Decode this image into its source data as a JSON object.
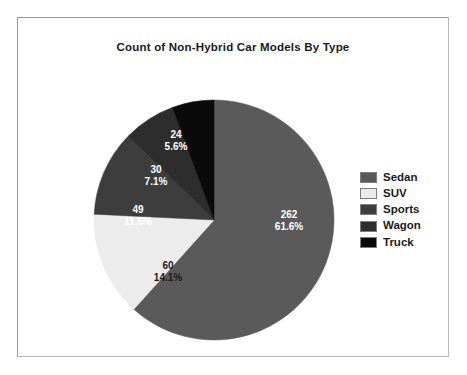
{
  "chart_data": {
    "type": "pie",
    "title": "Count of Non-Hybrid Car Models By Type",
    "xlabel": "",
    "ylabel": "",
    "total": 425,
    "legend_position": "right",
    "grid": false,
    "start_angle_deg": 0,
    "direction": "clockwise",
    "categories": [
      "Sedan",
      "SUV",
      "Sports",
      "Wagon",
      "Truck"
    ],
    "values": [
      262,
      60,
      49,
      30,
      24
    ],
    "percents": [
      "61.6%",
      "14.1%",
      "11.5%",
      "7.1%",
      "5.6%"
    ],
    "colors": [
      "#5a5a5a",
      "#ececec",
      "#3d3d3d",
      "#2d2d2d",
      "#0a0a0a"
    ],
    "label_colors": [
      "#ffffff",
      "#1a1a1a",
      "#ffffff",
      "#ffffff",
      "#ffffff"
    ],
    "slices": [
      {
        "name": "Sedan",
        "value": 262,
        "percent": "61.6%",
        "color": "#5a5a5a",
        "label_color": "#ffffff",
        "value_text": "262",
        "label_x": 271,
        "label_y": 202
      },
      {
        "name": "SUV",
        "value": 60,
        "percent": "14.1%",
        "color": "#ececec",
        "label_color": "#1a1a1a",
        "value_text": "60",
        "label_x": 150,
        "label_y": 253
      },
      {
        "name": "Sports",
        "value": 49,
        "percent": "11.5%",
        "color": "#3d3d3d",
        "label_color": "#ffffff",
        "value_text": "49",
        "label_x": 120,
        "label_y": 197
      },
      {
        "name": "Wagon",
        "value": 30,
        "percent": "7.1%",
        "color": "#2d2d2d",
        "label_color": "#ffffff",
        "value_text": "30",
        "label_x": 138,
        "label_y": 157
      },
      {
        "name": "Truck",
        "value": 24,
        "percent": "5.6%",
        "color": "#0a0a0a",
        "label_color": "#ffffff",
        "value_text": "24",
        "label_x": 158,
        "label_y": 122
      }
    ],
    "geometry": {
      "cx": 196,
      "cy": 202,
      "r": 120
    }
  },
  "legend": {
    "items": [
      {
        "label": "Sedan",
        "color": "#5a5a5a"
      },
      {
        "label": "SUV",
        "color": "#ececec"
      },
      {
        "label": "Sports",
        "color": "#3d3d3d"
      },
      {
        "label": "Wagon",
        "color": "#2d2d2d"
      },
      {
        "label": "Truck",
        "color": "#0a0a0a"
      }
    ]
  }
}
